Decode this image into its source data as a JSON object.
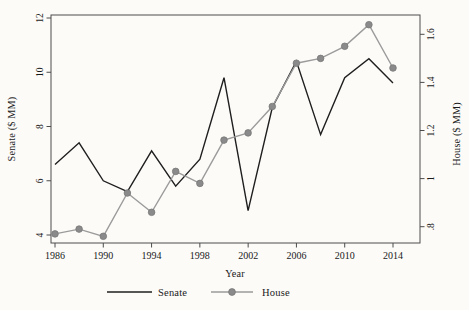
{
  "chart_data": {
    "type": "line",
    "title": "",
    "xlabel": "Year",
    "x": [
      1986,
      1988,
      1990,
      1992,
      1994,
      1996,
      1998,
      2000,
      2002,
      2004,
      2006,
      2008,
      2010,
      2012,
      2014
    ],
    "series": [
      {
        "name": "Senate",
        "axis": "left",
        "marker": "none",
        "color": "#1f1f1f",
        "values": [
          6.6,
          7.4,
          6.0,
          5.6,
          7.1,
          5.8,
          6.8,
          9.8,
          4.9,
          8.7,
          10.4,
          7.7,
          9.8,
          10.5,
          9.6
        ]
      },
      {
        "name": "House",
        "axis": "right",
        "marker": "circle",
        "color": "#9b9b9b",
        "marker_color": "#8a8a8a",
        "values": [
          0.77,
          0.79,
          0.76,
          0.94,
          0.86,
          1.03,
          0.98,
          1.16,
          1.19,
          1.3,
          1.48,
          1.5,
          1.55,
          1.64,
          1.46
        ]
      }
    ],
    "left_axis": {
      "label": "Senate ($ MM)",
      "range": [
        4,
        12
      ],
      "ticks": [
        4,
        6,
        8,
        10,
        12
      ],
      "tick_labels": [
        "4",
        "6",
        "8",
        "10",
        "12"
      ],
      "tick_label_rotation": -90
    },
    "right_axis": {
      "label": "House ($ MM)",
      "range": [
        0.8,
        1.6
      ],
      "ticks": [
        0.8,
        1.0,
        1.2,
        1.4,
        1.6
      ],
      "tick_labels": [
        ".8",
        "1",
        "1.2",
        "1.4",
        "1.6"
      ],
      "tick_label_rotation": -90
    },
    "x_ticks": [
      1986,
      1990,
      1994,
      1998,
      2002,
      2006,
      2010,
      2014
    ],
    "x_tick_labels": [
      "1986",
      "1990",
      "1994",
      "1998",
      "2002",
      "2006",
      "2010",
      "2014"
    ],
    "grid": false,
    "legend_position": "bottom-center"
  },
  "colors": {
    "background": "#fcfbf8",
    "frame": "#4c4c4c",
    "text": "#1a1a1a",
    "senate_line": "#1f1f1f",
    "house_line": "#9b9b9b",
    "house_marker_fill": "#8a8a8a",
    "house_marker_stroke": "#787878"
  }
}
